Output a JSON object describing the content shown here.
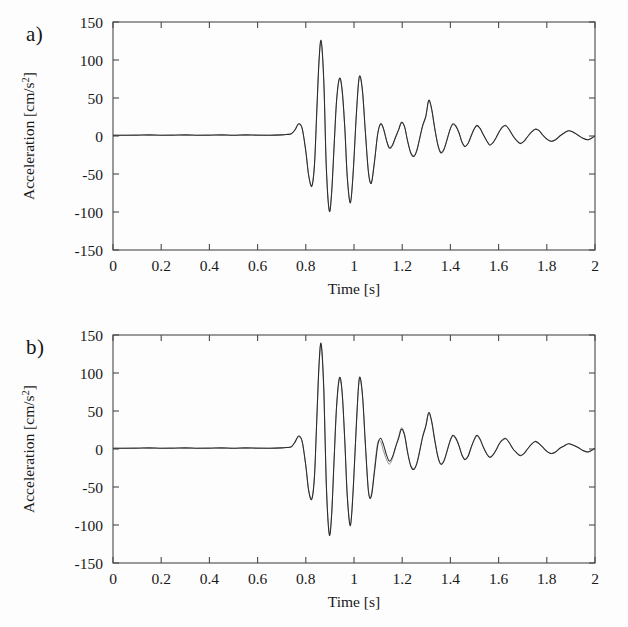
{
  "figure": {
    "background": "#fdfdfd",
    "trace_color_primary": "#2b2b2b",
    "trace_color_secondary": "#8d8d8d",
    "axis_color": "#4a4a4a"
  },
  "panels": [
    {
      "id": "a",
      "label": "a)"
    },
    {
      "id": "b",
      "label": "b)"
    }
  ],
  "chart_data": [
    {
      "type": "line",
      "panel": "a",
      "title": "",
      "xlabel": "Time [s]",
      "ylabel": "Acceleration [cm/s2]",
      "ylabel_base": "Acceleration [cm/s",
      "ylabel_sup": "2",
      "ylabel_tail": "]",
      "xlim": [
        0,
        2
      ],
      "ylim": [
        -150,
        150
      ],
      "xticks": [
        0,
        0.2,
        0.4,
        0.6,
        0.8,
        1,
        1.2,
        1.4,
        1.6,
        1.8,
        2
      ],
      "xticklabels": [
        "0",
        "0.2",
        "0.4",
        "0.6",
        "0.8",
        "1",
        "1.2",
        "1.4",
        "1.6",
        "1.8",
        "2"
      ],
      "yticks": [
        150,
        100,
        50,
        0,
        -50,
        -100,
        -150
      ],
      "yticklabels": [
        "150",
        "100",
        "50",
        "0",
        "-50",
        "-100",
        "-150"
      ],
      "grid": false,
      "legend": "none",
      "series": [
        {
          "name": "recorded",
          "color": "#2b2b2b",
          "x": [
            0,
            0.05,
            0.1,
            0.15,
            0.2,
            0.25,
            0.3,
            0.35,
            0.4,
            0.45,
            0.5,
            0.55,
            0.6,
            0.65,
            0.7,
            0.72,
            0.74,
            0.755,
            0.77,
            0.785,
            0.8,
            0.812,
            0.825,
            0.836,
            0.845,
            0.855,
            0.864,
            0.875,
            0.885,
            0.897,
            0.907,
            0.918,
            0.928,
            0.94,
            0.951,
            0.962,
            0.972,
            0.985,
            0.997,
            1.01,
            1.022,
            1.035,
            1.047,
            1.06,
            1.072,
            1.085,
            1.098,
            1.11,
            1.122,
            1.135,
            1.147,
            1.16,
            1.172,
            1.185,
            1.197,
            1.21,
            1.222,
            1.235,
            1.248,
            1.26,
            1.272,
            1.285,
            1.298,
            1.31,
            1.322,
            1.335,
            1.348,
            1.36,
            1.373,
            1.385,
            1.398,
            1.41,
            1.423,
            1.436,
            1.448,
            1.46,
            1.473,
            1.486,
            1.498,
            1.51,
            1.523,
            1.536,
            1.55,
            1.563,
            1.576,
            1.59,
            1.603,
            1.616,
            1.63,
            1.645,
            1.66,
            1.675,
            1.69,
            1.705,
            1.72,
            1.736,
            1.752,
            1.768,
            1.784,
            1.8,
            1.818,
            1.836,
            1.854,
            1.872,
            1.89,
            1.91,
            1.93,
            1.95,
            1.97,
            1.985,
            2
          ],
          "y": [
            1,
            1,
            1,
            1.5,
            1,
            1,
            1.5,
            1,
            1,
            1.5,
            1,
            1.5,
            1,
            1,
            1.5,
            2,
            3,
            8,
            16,
            10,
            -20,
            -52,
            -66,
            -38,
            28,
            100,
            125,
            70,
            -40,
            -98,
            -76,
            -10,
            48,
            76,
            60,
            10,
            -54,
            -88,
            -46,
            30,
            78,
            60,
            6,
            -48,
            -62,
            -34,
            2,
            16,
            10,
            -6,
            -16,
            -12,
            -2,
            8,
            18,
            12,
            -6,
            -22,
            -27,
            -20,
            -4,
            14,
            26,
            47,
            36,
            10,
            -12,
            -22,
            -18,
            -6,
            8,
            16,
            13,
            4,
            -8,
            -14,
            -10,
            0,
            9,
            14,
            10,
            2,
            -6,
            -12,
            -9,
            -2,
            6,
            12,
            14,
            8,
            0,
            -6,
            -10,
            -7,
            -1,
            5,
            9,
            7,
            1,
            -4,
            -7,
            -5,
            0,
            4,
            7,
            5,
            1,
            -3,
            -5,
            -3,
            0,
            2
          ]
        },
        {
          "name": "simulated",
          "color": "#8d8d8d",
          "x": [
            0,
            0.05,
            0.1,
            0.15,
            0.2,
            0.25,
            0.3,
            0.35,
            0.4,
            0.45,
            0.5,
            0.55,
            0.6,
            0.65,
            0.7,
            0.72,
            0.74,
            0.755,
            0.77,
            0.785,
            0.8,
            0.812,
            0.825,
            0.836,
            0.845,
            0.855,
            0.864,
            0.875,
            0.885,
            0.897,
            0.907,
            0.918,
            0.928,
            0.94,
            0.951,
            0.962,
            0.972,
            0.985,
            0.997,
            1.01,
            1.022,
            1.035,
            1.047,
            1.06,
            1.072,
            1.085,
            1.098,
            1.11,
            1.122,
            1.135,
            1.147,
            1.16,
            1.172,
            1.185,
            1.197,
            1.21,
            1.222,
            1.235,
            1.248,
            1.26,
            1.272,
            1.285,
            1.298,
            1.31,
            1.322,
            1.335,
            1.348,
            1.36,
            1.373,
            1.385,
            1.398,
            1.41,
            1.423,
            1.436,
            1.448,
            1.46,
            1.473,
            1.486,
            1.498,
            1.51,
            1.523,
            1.536,
            1.55,
            1.563,
            1.576,
            1.59,
            1.603,
            1.616,
            1.63,
            1.645,
            1.66,
            1.675,
            1.69,
            1.705,
            1.72,
            1.736,
            1.752,
            1.768,
            1.784,
            1.8,
            1.818,
            1.836,
            1.854,
            1.872,
            1.89,
            1.91,
            1.93,
            1.95,
            1.97,
            1.985,
            2
          ],
          "y": [
            1,
            1,
            1.5,
            1,
            1,
            1.5,
            1,
            1,
            1.5,
            1,
            1,
            1,
            1.5,
            1,
            1.5,
            2,
            3,
            8,
            15,
            9,
            -20,
            -52,
            -65,
            -37,
            27,
            99,
            123,
            68,
            -40,
            -97,
            -75,
            -9,
            47,
            75,
            58,
            9,
            -53,
            -87,
            -45,
            29,
            77,
            59,
            6,
            -47,
            -61,
            -33,
            2,
            15,
            10,
            -6,
            -15,
            -11,
            -2,
            8,
            17,
            12,
            -6,
            -21,
            -26,
            -19,
            -4,
            13,
            25,
            46,
            35,
            10,
            -11,
            -21,
            -17,
            -6,
            8,
            15,
            12,
            4,
            -8,
            -13,
            -10,
            0,
            9,
            13,
            10,
            2,
            -6,
            -11,
            -9,
            -2,
            6,
            11,
            13,
            8,
            0,
            -6,
            -9,
            -7,
            -1,
            5,
            9,
            7,
            1,
            -4,
            -7,
            -5,
            0,
            4,
            7,
            5,
            1,
            -3,
            -5,
            -3,
            0,
            2
          ]
        }
      ]
    },
    {
      "type": "line",
      "panel": "b",
      "title": "",
      "xlabel": "Time [s]",
      "ylabel": "Acceleration [cm/s2]",
      "ylabel_base": "Acceleration [cm/s",
      "ylabel_sup": "2",
      "ylabel_tail": "]",
      "xlim": [
        0,
        2
      ],
      "ylim": [
        -150,
        150
      ],
      "xticks": [
        0,
        0.2,
        0.4,
        0.6,
        0.8,
        1,
        1.2,
        1.4,
        1.6,
        1.8,
        2
      ],
      "xticklabels": [
        "0",
        "0.2",
        "0.4",
        "0.6",
        "0.8",
        "1",
        "1.2",
        "1.4",
        "1.6",
        "1.8",
        "2"
      ],
      "yticks": [
        150,
        100,
        50,
        0,
        -50,
        -100,
        -150
      ],
      "yticklabels": [
        "150",
        "100",
        "50",
        "0",
        "-50",
        "-100",
        "-150"
      ],
      "grid": false,
      "legend": "none",
      "series": [
        {
          "name": "recorded",
          "color": "#2b2b2b",
          "x": [
            0,
            0.05,
            0.1,
            0.15,
            0.2,
            0.25,
            0.3,
            0.35,
            0.4,
            0.45,
            0.5,
            0.55,
            0.6,
            0.65,
            0.7,
            0.72,
            0.74,
            0.755,
            0.77,
            0.785,
            0.8,
            0.812,
            0.825,
            0.836,
            0.845,
            0.855,
            0.864,
            0.875,
            0.885,
            0.897,
            0.907,
            0.918,
            0.928,
            0.94,
            0.951,
            0.962,
            0.972,
            0.985,
            0.997,
            1.01,
            1.022,
            1.035,
            1.047,
            1.06,
            1.072,
            1.085,
            1.098,
            1.11,
            1.122,
            1.135,
            1.147,
            1.16,
            1.172,
            1.185,
            1.197,
            1.21,
            1.222,
            1.235,
            1.248,
            1.26,
            1.272,
            1.285,
            1.298,
            1.31,
            1.322,
            1.335,
            1.348,
            1.36,
            1.373,
            1.385,
            1.398,
            1.41,
            1.423,
            1.436,
            1.448,
            1.46,
            1.473,
            1.486,
            1.498,
            1.51,
            1.523,
            1.536,
            1.55,
            1.563,
            1.576,
            1.59,
            1.603,
            1.616,
            1.63,
            1.645,
            1.66,
            1.675,
            1.69,
            1.705,
            1.72,
            1.736,
            1.752,
            1.768,
            1.784,
            1.8,
            1.818,
            1.836,
            1.854,
            1.872,
            1.89,
            1.91,
            1.93,
            1.95,
            1.97,
            1.985,
            2
          ],
          "y": [
            1,
            1,
            1,
            1.5,
            1,
            1,
            1.5,
            1,
            1,
            1.5,
            1,
            1.5,
            1,
            1,
            1.5,
            2,
            3,
            9,
            17,
            10,
            -22,
            -55,
            -66,
            -36,
            34,
            112,
            138,
            76,
            -46,
            -112,
            -88,
            -10,
            58,
            94,
            74,
            10,
            -62,
            -101,
            -52,
            34,
            93,
            72,
            8,
            -56,
            -62,
            -30,
            4,
            14,
            6,
            -8,
            -16,
            -10,
            2,
            14,
            26,
            18,
            -4,
            -22,
            -27,
            -20,
            -4,
            16,
            30,
            48,
            37,
            12,
            -10,
            -20,
            -16,
            -4,
            10,
            18,
            14,
            4,
            -8,
            -14,
            -10,
            2,
            12,
            18,
            13,
            3,
            -6,
            -11,
            -8,
            -1,
            7,
            12,
            14,
            8,
            0,
            -5,
            -9,
            -6,
            0,
            6,
            10,
            7,
            2,
            -3,
            -6,
            -4,
            1,
            4,
            7,
            5,
            2,
            -2,
            -4,
            -2,
            1,
            3
          ]
        },
        {
          "name": "simulated",
          "color": "#8d8d8d",
          "x": [
            0,
            0.05,
            0.1,
            0.15,
            0.2,
            0.25,
            0.3,
            0.35,
            0.4,
            0.45,
            0.5,
            0.55,
            0.6,
            0.65,
            0.7,
            0.72,
            0.74,
            0.755,
            0.77,
            0.785,
            0.8,
            0.812,
            0.825,
            0.836,
            0.845,
            0.855,
            0.864,
            0.875,
            0.885,
            0.897,
            0.907,
            0.918,
            0.928,
            0.94,
            0.951,
            0.962,
            0.972,
            0.985,
            0.997,
            1.01,
            1.022,
            1.035,
            1.047,
            1.06,
            1.072,
            1.085,
            1.098,
            1.11,
            1.122,
            1.135,
            1.147,
            1.16,
            1.172,
            1.185,
            1.197,
            1.21,
            1.222,
            1.235,
            1.248,
            1.26,
            1.272,
            1.285,
            1.298,
            1.31,
            1.322,
            1.335,
            1.348,
            1.36,
            1.373,
            1.385,
            1.398,
            1.41,
            1.423,
            1.436,
            1.448,
            1.46,
            1.473,
            1.486,
            1.498,
            1.51,
            1.523,
            1.536,
            1.55,
            1.563,
            1.576,
            1.59,
            1.603,
            1.616,
            1.63,
            1.645,
            1.66,
            1.675,
            1.69,
            1.705,
            1.72,
            1.736,
            1.752,
            1.768,
            1.784,
            1.8,
            1.818,
            1.836,
            1.854,
            1.872,
            1.89,
            1.91,
            1.93,
            1.95,
            1.97,
            1.985,
            2
          ],
          "y": [
            1,
            1,
            1.5,
            1,
            1,
            1.5,
            1,
            1,
            1.5,
            1,
            1,
            1,
            1.5,
            1,
            1.5,
            2,
            3,
            9,
            16,
            9,
            -22,
            -54,
            -65,
            -35,
            33,
            110,
            136,
            74,
            -45,
            -110,
            -86,
            -9,
            56,
            92,
            72,
            8,
            -60,
            -99,
            -50,
            32,
            91,
            70,
            6,
            -55,
            -60,
            -26,
            8,
            10,
            -2,
            -14,
            -20,
            -12,
            2,
            16,
            28,
            19,
            -3,
            -21,
            -26,
            -19,
            -3,
            17,
            31,
            47,
            36,
            11,
            -10,
            -19,
            -15,
            -4,
            10,
            17,
            13,
            4,
            -8,
            -13,
            -9,
            2,
            11,
            17,
            12,
            3,
            -6,
            -10,
            -8,
            -1,
            7,
            11,
            13,
            8,
            0,
            -5,
            -8,
            -6,
            0,
            6,
            10,
            7,
            2,
            -3,
            -6,
            -4,
            1,
            4,
            7,
            5,
            2,
            -2,
            -4,
            -2,
            1,
            3
          ]
        }
      ]
    }
  ]
}
